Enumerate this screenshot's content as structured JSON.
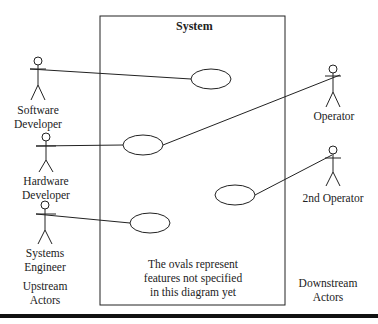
{
  "diagram": {
    "system_title": "System",
    "note": [
      "The ovals represent",
      "features not specified",
      "in this diagram yet"
    ],
    "upstream_label": [
      "Upstream",
      "Actors"
    ],
    "downstream_label": [
      "Downstream",
      "Actors"
    ],
    "actors": [
      {
        "name_lines": [
          "Software",
          "Developer"
        ],
        "side": "upstream"
      },
      {
        "name_lines": [
          "Hardware",
          "Developer"
        ],
        "side": "upstream"
      },
      {
        "name_lines": [
          "Systems",
          "Engineer"
        ],
        "side": "upstream"
      },
      {
        "name_lines": [
          "Operator"
        ],
        "side": "downstream"
      },
      {
        "name_lines": [
          "2nd Operator"
        ],
        "side": "downstream"
      }
    ],
    "use_cases": [
      "oval-1",
      "oval-2",
      "oval-3",
      "oval-4"
    ],
    "colors": {
      "line": "#222222",
      "background": "#ffffff"
    }
  }
}
